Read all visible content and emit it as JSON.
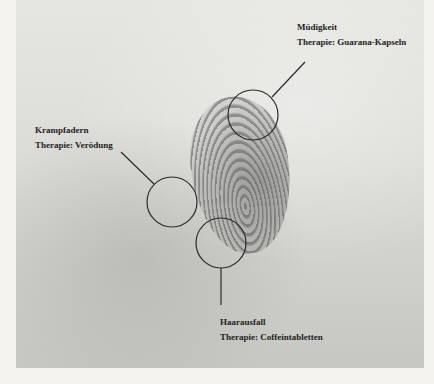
{
  "annotations": [
    {
      "id": "muedigkeit",
      "title": "Müdigkeit",
      "therapy": "Therapie: Guarana-Kapseln"
    },
    {
      "id": "krampfadern",
      "title": "Krampfadern",
      "therapy": "Therapie: Verödung"
    },
    {
      "id": "haarausfall",
      "title": "Haarausfall",
      "therapy": "Therapie: Coffeintabletten"
    }
  ],
  "colors": {
    "line": "#2a2a2a",
    "text": "#1e1e1e",
    "page": "#f4f3ef"
  }
}
